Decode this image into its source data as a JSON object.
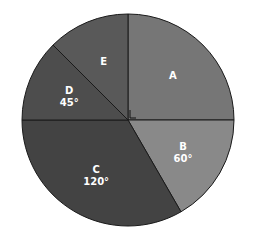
{
  "chart_data": {
    "type": "pie",
    "title": "",
    "unit": "degrees",
    "slices": [
      {
        "label": "A",
        "value": 90,
        "angle_text": "",
        "color": "#767676"
      },
      {
        "label": "B",
        "value": 60,
        "angle_text": "60°",
        "color": "#898989"
      },
      {
        "label": "C",
        "value": 120,
        "angle_text": "120°",
        "color": "#434343"
      },
      {
        "label": "D",
        "value": 45,
        "angle_text": "45°",
        "color": "#4d4d4d"
      },
      {
        "label": "E",
        "value": 45,
        "angle_text": "",
        "color": "#595959"
      }
    ],
    "annotations": [
      "right-angle marker at center for slice A"
    ],
    "categories": [
      "A",
      "B",
      "C",
      "D",
      "E"
    ],
    "values": [
      90,
      60,
      120,
      45,
      45
    ]
  }
}
